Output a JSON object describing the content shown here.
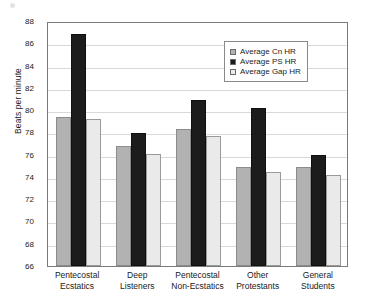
{
  "chart_data": {
    "type": "bar",
    "title": "",
    "xlabel": "",
    "ylabel": "Beats per minute",
    "ylim": [
      66,
      88
    ],
    "ytick_step": 2,
    "yticks": [
      88,
      86,
      84,
      82,
      80,
      78,
      76,
      74,
      72,
      70,
      68,
      66
    ],
    "grid": true,
    "legend_position": "upper right",
    "categories": [
      "Pentecostal Ecstatics",
      "Deep Listeners",
      "Pentecostal Non-Ecstatics",
      "Other Protestants",
      "General Students"
    ],
    "category_lines": [
      [
        "Pentecostal",
        "Ecstatics"
      ],
      [
        "Deep",
        "Listeners"
      ],
      [
        "Pentecostal",
        "Non-Ecstatics"
      ],
      [
        "Other",
        "Protestants"
      ],
      [
        "General",
        "Students"
      ]
    ],
    "series": [
      {
        "name": "Average Cn HR",
        "color": "#b2b2b2",
        "values": [
          79.4,
          76.8,
          78.3,
          74.9,
          74.9
        ]
      },
      {
        "name": "Average PS HR",
        "color": "#1c1c1c",
        "values": [
          86.8,
          77.9,
          80.9,
          80.2,
          76.0
        ]
      },
      {
        "name": "Average Gap HR",
        "color": "#eaeaea",
        "values": [
          79.2,
          76.1,
          77.7,
          74.4,
          74.2
        ]
      }
    ]
  },
  "legend": {
    "items": [
      {
        "label": "Average Cn HR"
      },
      {
        "label": "Average PS HR"
      },
      {
        "label": "Average Gap HR"
      }
    ]
  }
}
